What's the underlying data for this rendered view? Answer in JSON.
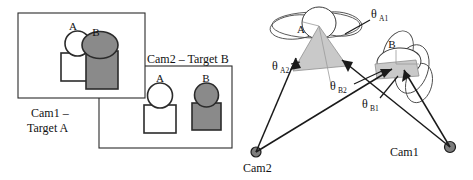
{
  "figure": {
    "colors": {
      "target_a_fill": "#ffffff",
      "target_b_fill": "#8a8a8a",
      "outline": "#2b2b2b",
      "wedge_fill": "#c9c9c9",
      "camera_dot": "#7d7d7d"
    }
  },
  "left_panel": {
    "cam1_view": {
      "caption_line1": "Cam1 –",
      "caption_line2": "Target A",
      "shape_labels": {
        "a": "A",
        "b": "B"
      }
    },
    "cam2_view": {
      "caption": "Cam2 – Target B",
      "shape_labels": {
        "a": "A",
        "b": "B"
      }
    }
  },
  "right_panel": {
    "cluster_labels": {
      "a": "A",
      "b": "B"
    },
    "cameras": [
      {
        "name": "Cam2",
        "label": "Cam2"
      },
      {
        "name": "Cam1",
        "label": "Cam1"
      }
    ],
    "angles": [
      {
        "id": "theta_a1",
        "symbol": "θ",
        "subscript": "A1"
      },
      {
        "id": "theta_a2",
        "symbol": "θ",
        "subscript": "A2"
      },
      {
        "id": "theta_b1",
        "symbol": "θ",
        "subscript": "B1"
      },
      {
        "id": "theta_b2",
        "symbol": "θ",
        "subscript": "B2"
      }
    ]
  }
}
